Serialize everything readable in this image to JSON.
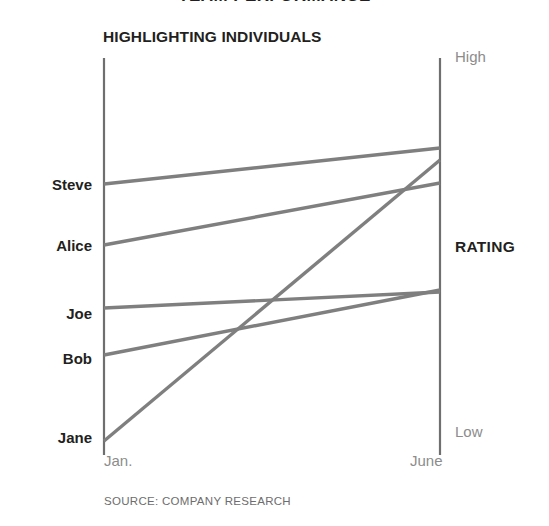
{
  "title": "TEAM PERFORMANCE",
  "subtitle": "HIGHLIGHTING INDIVIDUALS",
  "source": "SOURCE: COMPANY RESEARCH",
  "rating_axis_title": "RATING",
  "scale": {
    "high": "High",
    "low": "Low"
  },
  "x_ticks": {
    "start": "Jan.",
    "end": "June"
  },
  "people": [
    {
      "name": "Steve"
    },
    {
      "name": "Alice"
    },
    {
      "name": "Joe"
    },
    {
      "name": "Bob"
    },
    {
      "name": "Jane"
    }
  ],
  "colors": {
    "line": "#7f7f7f",
    "axis": "#6f6f6f",
    "text": "#231f20",
    "muted": "#8c8c8c",
    "background": "#ffffff"
  },
  "chart_data": {
    "type": "line",
    "title": "TEAM PERFORMANCE",
    "subtitle": "HIGHLIGHTING INDIVIDUALS",
    "xlabel": "",
    "ylabel": "RATING",
    "x": [
      "Jan.",
      "June"
    ],
    "ytick_labels": [
      "Low",
      "High"
    ],
    "ylim": [
      0,
      100
    ],
    "grid": false,
    "legend": "left-axis-labels",
    "annotations": [
      "SOURCE: COMPANY RESEARCH"
    ],
    "series": [
      {
        "name": "Steve",
        "values": [
          68,
          77
        ]
      },
      {
        "name": "Alice",
        "values": [
          53,
          68
        ]
      },
      {
        "name": "Joe",
        "values": [
          37,
          41
        ]
      },
      {
        "name": "Bob",
        "values": [
          25,
          41
        ]
      },
      {
        "name": "Jane",
        "values": [
          4,
          73
        ]
      }
    ],
    "series_pixels": [
      {
        "name": "Steve",
        "x1": 104,
        "y1": 184,
        "x2": 440,
        "y2": 148
      },
      {
        "name": "Alice",
        "x1": 104,
        "y1": 245,
        "x2": 440,
        "y2": 183
      },
      {
        "name": "Joe",
        "x1": 104,
        "y1": 308,
        "x2": 440,
        "y2": 292
      },
      {
        "name": "Bob",
        "x1": 104,
        "y1": 355,
        "x2": 440,
        "y2": 290
      },
      {
        "name": "Jane",
        "x1": 104,
        "y1": 441,
        "x2": 440,
        "y2": 160
      }
    ],
    "label_positions_px": [
      {
        "name": "Steve",
        "y": 184
      },
      {
        "name": "Alice",
        "y": 245
      },
      {
        "name": "Joe",
        "y": 313
      },
      {
        "name": "Bob",
        "y": 358
      },
      {
        "name": "Jane",
        "y": 437
      }
    ]
  }
}
